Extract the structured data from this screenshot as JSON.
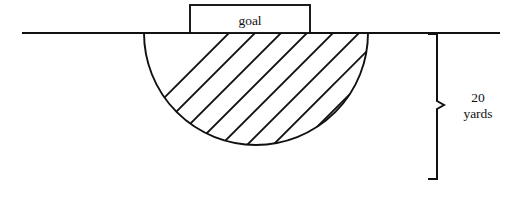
{
  "diagram": {
    "background_color": "#ffffff",
    "stroke_color": "#111111",
    "goal": {
      "label": "goal",
      "box": {
        "x": 190,
        "y": 5,
        "width": 120,
        "height": 28
      }
    },
    "ground_line": {
      "name": "goal-line",
      "x1": 22,
      "y1": 33,
      "x2": 500,
      "y2": 33
    },
    "hatched_region": {
      "shape": "circle",
      "center_x": 256,
      "center_y": 112,
      "radius": 112,
      "clipped_above_y": 33,
      "hatch_angle_degrees": 45,
      "hatch_spacing": 26,
      "hatch_count": 10
    },
    "measurement": {
      "name": "depth-measure",
      "value": "20",
      "unit": "yards",
      "label_line_1": "20",
      "label_line_2": "yards",
      "bracket_x": 437,
      "bracket_top_y": 33,
      "bracket_bottom_y": 180,
      "bracket_mid_y": 105,
      "nub_length": 9,
      "label_x": 478,
      "label_y": 100
    }
  }
}
